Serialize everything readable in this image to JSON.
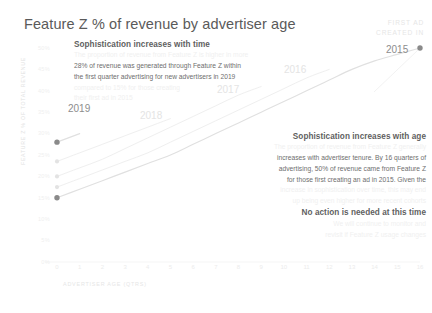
{
  "header": {
    "title": "Feature Z % of revenue by advertiser age"
  },
  "callout": {
    "line1": "FIRST AD",
    "line2": "CREATED IN",
    "marker_year": "2015"
  },
  "annotations": {
    "time": {
      "heading": "Sophistication increases with time",
      "lines": [
        {
          "text": "The proportion of revenue from Feature Z is higher in more",
          "visible": false
        },
        {
          "text": "28% of revenue was generated through Feature Z within",
          "visible": true
        },
        {
          "text": "the first quarter advertising for new advertisers in 2019",
          "visible": true
        },
        {
          "text": "compared to 15% for those creating",
          "visible": false
        },
        {
          "text": "their first ad in 2015",
          "visible": false
        }
      ]
    },
    "age": {
      "heading": "Sophistication increases with age",
      "lines": [
        {
          "text": "The proportion of revenue from Feature Z generally",
          "visible": false
        },
        {
          "text": "increases with advertiser tenure. By 16 quarters of",
          "visible": true
        },
        {
          "text": "advertising, 50% of revenue came from Feature Z",
          "visible": true
        },
        {
          "text": "for those first creating an ad in 2015. Given the",
          "visible": true
        },
        {
          "text": "increase in sophistication over time, this may end",
          "visible": false
        },
        {
          "text": "up being even higher for more recent cohorts",
          "visible": false
        }
      ]
    },
    "no_action": {
      "heading": "No action is needed at this time",
      "lines": [
        {
          "text": "We will continue to monitor and",
          "visible": false
        },
        {
          "text": "revisit if Feature Z usage changes",
          "visible": false
        }
      ]
    }
  },
  "chart_data": {
    "type": "line",
    "title": "Feature Z % of revenue by advertiser age",
    "xlabel": "ADVERTISER AGE (QTRS)",
    "ylabel": "FEATURE Z % OF TOTAL REVENUE",
    "xlim": [
      0,
      16
    ],
    "ylim": [
      0,
      50
    ],
    "grid": false,
    "legend": "inline-labels",
    "x": [
      0,
      1,
      2,
      3,
      4,
      5,
      6,
      7,
      8,
      9,
      10,
      11,
      12,
      13,
      14,
      15,
      16
    ],
    "xtick_labels": [
      "0",
      "1",
      "2",
      "3",
      "4",
      "5",
      "6",
      "7",
      "8",
      "9",
      "10",
      "11",
      "12",
      "13",
      "14",
      "15",
      "16"
    ],
    "ytick_labels": [
      "0%",
      "5%",
      "10%",
      "15%",
      "20%",
      "25%",
      "30%",
      "35%",
      "40%",
      "45%",
      "50%"
    ],
    "ytick_values": [
      0,
      5,
      10,
      15,
      20,
      25,
      30,
      35,
      40,
      45,
      50
    ],
    "series": [
      {
        "name": "2015",
        "label": "2015",
        "emphasis": "strong",
        "values": [
          15,
          17,
          19,
          21,
          23,
          25,
          27.5,
          30,
          32.5,
          35,
          37.5,
          40,
          42.5,
          45,
          47,
          48.5,
          50
        ]
      },
      {
        "name": "2016",
        "label": "2016",
        "emphasis": "faint",
        "values": [
          17.5,
          19.5,
          21.5,
          23.5,
          25.5,
          28,
          30.5,
          33,
          35.5,
          38,
          40.5,
          43,
          45,
          null,
          null,
          null,
          null
        ]
      },
      {
        "name": "2017",
        "label": "2017",
        "emphasis": "faint",
        "values": [
          20,
          22,
          24,
          26.5,
          29,
          31.5,
          34,
          36.5,
          39,
          41,
          null,
          null,
          null,
          null,
          null,
          null,
          null
        ]
      },
      {
        "name": "2018",
        "label": "2018",
        "emphasis": "faint",
        "values": [
          23.5,
          25.5,
          27.5,
          29.5,
          31.5,
          33.5,
          null,
          null,
          null,
          null,
          null,
          null,
          null,
          null,
          null,
          null,
          null
        ]
      },
      {
        "name": "2019",
        "label": "2019",
        "emphasis": "strong",
        "values": [
          28,
          30,
          null,
          null,
          null,
          null,
          null,
          null,
          null,
          null,
          null,
          null,
          null,
          null,
          null,
          null,
          null
        ]
      }
    ],
    "markers": [
      {
        "series": "2015",
        "x": 0,
        "y": 15
      },
      {
        "series": "2016",
        "x": 0,
        "y": 17.5
      },
      {
        "series": "2017",
        "x": 0,
        "y": 20
      },
      {
        "series": "2018",
        "x": 0,
        "y": 23.5
      },
      {
        "series": "2019",
        "x": 0,
        "y": 28
      },
      {
        "series": "2015",
        "x": 16,
        "y": 50
      }
    ]
  }
}
